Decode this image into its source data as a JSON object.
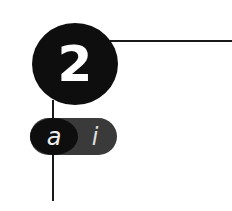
{
  "step": {
    "number": "2"
  },
  "toggle": {
    "left_label": "a",
    "right_label": "i"
  },
  "colors": {
    "circle": "#0e0e0e",
    "pill_bg": "#3a3a3a",
    "line": "#1a1a1a"
  }
}
